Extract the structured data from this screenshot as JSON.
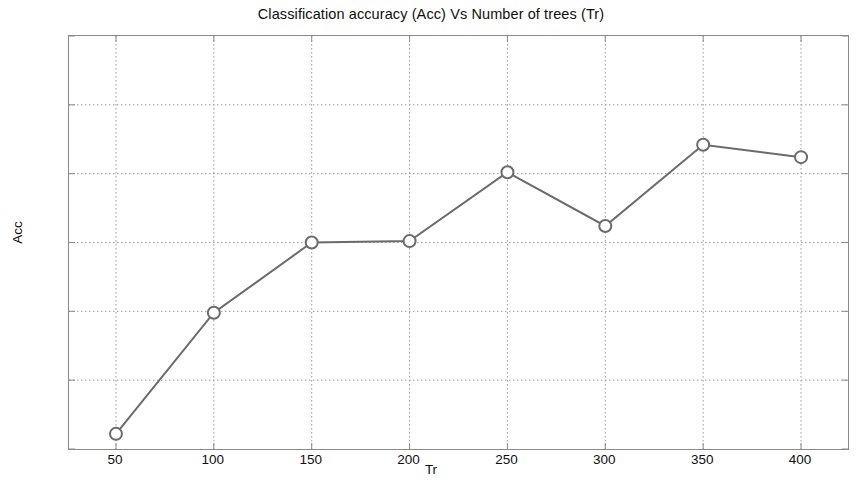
{
  "chart_data": {
    "type": "line",
    "title": "Classification accuracy (Acc) Vs Number of trees (Tr)",
    "xlabel": "Tr",
    "ylabel": "Acc",
    "x": [
      50,
      100,
      150,
      200,
      250,
      300,
      350,
      400
    ],
    "values": [
      93.861,
      93.949,
      94.0,
      94.001,
      94.051,
      94.012,
      94.071,
      94.062
    ],
    "series": [
      {
        "name": "Acc",
        "values": [
          93.861,
          93.949,
          94.0,
          94.001,
          94.051,
          94.012,
          94.071,
          94.062
        ]
      }
    ],
    "xlim": [
      26,
      424
    ],
    "ylim": [
      93.85,
      94.15
    ],
    "xticks": [
      50,
      100,
      150,
      200,
      250,
      300,
      350,
      400
    ],
    "xtick_labels": [
      "50",
      "100",
      "150",
      "200",
      "250",
      "300",
      "350",
      "400"
    ],
    "yticks": [
      93.85,
      93.9,
      93.95,
      94.0,
      94.05,
      94.1,
      94.15
    ],
    "ytick_labels": [
      "93.85",
      "93.9",
      "93.95",
      "94",
      "94.05",
      "94.1",
      "94.15"
    ],
    "grid": true,
    "grid_style": "dotted",
    "legend": null,
    "line_color": "#6b6b6b",
    "marker": "circle",
    "marker_edge_color": "#6b6b6b",
    "marker_face_color": "#ffffff",
    "axis_color": "#8a8a8a",
    "grid_color": "#9a9a9a",
    "background_color": "#ffffff"
  }
}
